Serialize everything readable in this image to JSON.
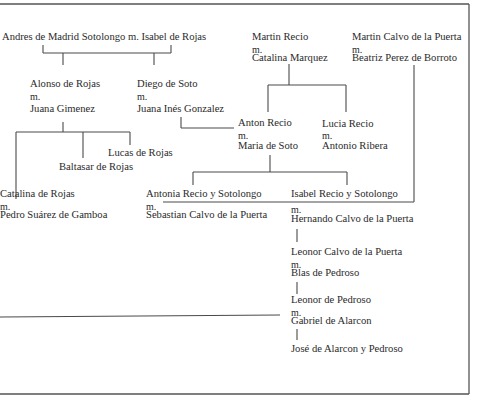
{
  "diagram": {
    "type": "family-tree",
    "root": {
      "label": "Andres de Madrid Sotolongo m. Isabel de Rojas"
    },
    "couples": {
      "alonso": {
        "person": "Alonso de Rojas",
        "marker": "m.",
        "spouse": "Juana Gimenez"
      },
      "diego": {
        "person": "Diego de Soto",
        "marker": "m.",
        "spouse": "Juana Inés Gonzalez"
      },
      "martin_recio": {
        "person": "Martin Recio",
        "marker": "m.",
        "spouse": "Catalina Marquez"
      },
      "martin_calvo": {
        "person": "Martin Calvo de la Puerta",
        "marker": "m.",
        "spouse": "Beatriz Perez de Borroto"
      },
      "anton": {
        "person": "Anton Recio",
        "marker": "m.",
        "spouse": "Maria de Soto"
      },
      "lucia": {
        "person": "Lucia Recio",
        "marker": "m.",
        "spouse": "Antonio Ribera"
      },
      "catalina": {
        "person": "Catalina de Rojas",
        "marker": "m.",
        "spouse": "Pedro Suárez de Gamboa"
      },
      "antonia": {
        "person": "Antonia Recio y Sotolongo",
        "marker": "m.",
        "spouse": "Sebastian Calvo de la Puerta"
      },
      "isabel": {
        "person": "Isabel Recio y Sotolongo",
        "marker": "m.",
        "spouse": "Hernando Calvo de la Puerta"
      },
      "leonor_calvo": {
        "person": "Leonor Calvo de la Puerta",
        "marker": "m.",
        "spouse": "Blas de Pedroso"
      },
      "leonor_pedroso": {
        "person": "Leonor de Pedroso",
        "marker": "m.",
        "spouse": "Gabriel de Alarcon"
      }
    },
    "singles": {
      "lucas": "Lucas de Rojas",
      "baltasar": "Baltasar de Rojas",
      "jose": "José de Alarcon y Pedroso"
    }
  }
}
